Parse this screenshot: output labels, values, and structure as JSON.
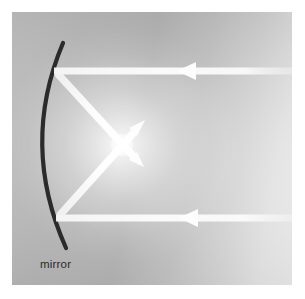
{
  "figure": {
    "domain_kind": "physics-optics-diagram",
    "title_text": "",
    "labels": [
      {
        "name": "mirror",
        "text": "mirror",
        "x": 40,
        "y": 258,
        "color": "#2a2a2a"
      }
    ],
    "panel": {
      "x": 12,
      "y": 12,
      "width": 280,
      "height": 273,
      "background_left_color": "#c9c9c9",
      "background_right_color": "#fafafa",
      "glow_color": "#ffffff",
      "glow_center_x": 122,
      "glow_center_y": 145
    },
    "mirror": {
      "name": "concave-mirror-arc",
      "stroke_color": "#2b2b2b",
      "stroke_width": 4.2,
      "top_x": 63,
      "top_y": 43,
      "vertex_x": 34,
      "vertex_y": 146,
      "bottom_x": 66,
      "bottom_y": 248
    },
    "rays": [
      {
        "name": "incoming-ray-upper",
        "kind": "incident",
        "direction": "leftward",
        "color": "#f2f2f2",
        "width": 7,
        "start_x": 292,
        "start_y": 71,
        "end_x": 54,
        "end_y": 71,
        "arrow_tip_x": 178,
        "arrow_tip_y": 71
      },
      {
        "name": "incoming-ray-lower",
        "kind": "incident",
        "direction": "leftward",
        "color": "#f2f2f2",
        "width": 7,
        "start_x": 292,
        "start_y": 218,
        "end_x": 56,
        "end_y": 218,
        "arrow_tip_x": 180,
        "arrow_tip_y": 218
      },
      {
        "name": "reflected-ray-upper-to-focus",
        "kind": "reflected",
        "direction": "down-right",
        "color": "#f2f2f2",
        "width": 7,
        "start_x": 57,
        "start_y": 73,
        "end_x": 143,
        "end_y": 166,
        "arrow_tip_x": 143,
        "arrow_tip_y": 166
      },
      {
        "name": "reflected-ray-lower-to-focus",
        "kind": "reflected",
        "direction": "up-right",
        "color": "#f2f2f2",
        "width": 7,
        "start_x": 59,
        "start_y": 216,
        "end_x": 144,
        "end_y": 121,
        "arrow_tip_x": 144,
        "arrow_tip_y": 121
      }
    ],
    "focal_point": {
      "name": "focus",
      "x": 122,
      "y": 145
    }
  }
}
